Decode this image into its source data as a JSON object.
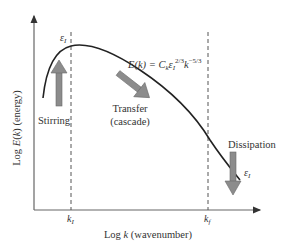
{
  "diagram": {
    "y_axis_label": "Log E(k) (energy)",
    "y_axis_label_parts": {
      "prefix": "Log ",
      "var": "E",
      "paren_open": "(",
      "k": "k",
      "paren_close": ")",
      "suffix": " (energy)"
    },
    "x_axis_label_parts": {
      "prefix": "Log ",
      "var": "k",
      "suffix": " (wavenumber)"
    },
    "x_ticks": [
      {
        "label": "k",
        "sub": "I"
      },
      {
        "label": "k",
        "sub": "f"
      }
    ],
    "equation": {
      "lhs": "E(k) = C",
      "c_sub": "k",
      "eps": "ε",
      "eps_sub": "I",
      "eps_exp": "2/3",
      "k": "k",
      "k_exp": "−5/3"
    },
    "annotations": {
      "peak_epsilon": {
        "sym": "ε",
        "sub": "I"
      },
      "stirring": "Stirring",
      "transfer_line1": "Transfer",
      "transfer_line2": "(cascade)",
      "dissipation": "Dissipation",
      "dissipation_epsilon": {
        "sym": "ε",
        "sub": "I"
      }
    },
    "colors": {
      "axis": "#555555",
      "curve": "#222222",
      "dashed": "#555555",
      "arrow_fill": "#8c8c8c",
      "arrow_stroke": "#6a6a6a",
      "text": "#333333"
    }
  }
}
